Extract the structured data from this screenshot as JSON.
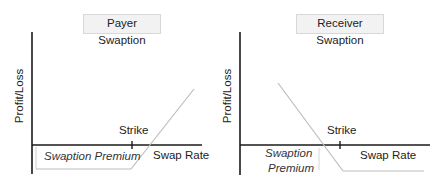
{
  "diagrams": [
    {
      "id": "payer",
      "title": "Payer Swaption",
      "ylabel": "Profit/Loss",
      "xlabel": "Swap Rate",
      "strike_label": "Strike",
      "premium_label": "Swaption Premium",
      "payoff": "flat loss (premium) below strike, rising linearly above strike"
    },
    {
      "id": "receiver",
      "title": "Receiver Swaption",
      "ylabel": "Profit/Loss",
      "xlabel": "Swap Rate",
      "strike_label": "Strike",
      "premium_label_line1": "Swaption",
      "premium_label_line2": "Premium",
      "payoff": "declining linearly below strike, flat loss (premium) above strike"
    }
  ],
  "colors": {
    "axis": "#1a1a1a",
    "payoff_line": "#bdbdbd",
    "title_bg": "#f2f2f2",
    "title_border": "#d8d8d8"
  }
}
